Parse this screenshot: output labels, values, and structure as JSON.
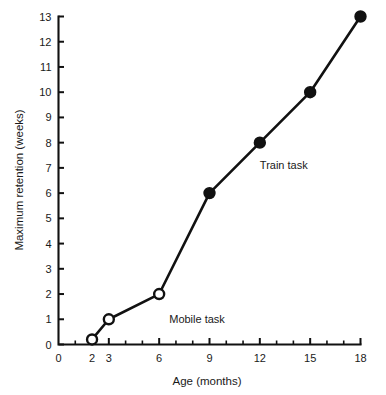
{
  "chart_data": {
    "type": "line",
    "title": "",
    "xlabel": "Age (months)",
    "ylabel": "Maximum retention (weeks)",
    "xlim": [
      0,
      18
    ],
    "ylim": [
      0,
      13
    ],
    "grid": false,
    "legend_position": "inline-annotation",
    "x_ticks_major": [
      0,
      2,
      3,
      6,
      9,
      12,
      15,
      18
    ],
    "x_tick_labels": [
      "0",
      "2",
      "3",
      "6",
      "9",
      "12",
      "15",
      "18"
    ],
    "x_ticks_minor": [
      1,
      4,
      5,
      7,
      8,
      10,
      11,
      13,
      14,
      16,
      17
    ],
    "y_ticks_major": [
      0,
      1,
      2,
      3,
      4,
      5,
      6,
      7,
      8,
      9,
      10,
      11,
      12,
      13
    ],
    "y_tick_labels": [
      "0",
      "1",
      "2",
      "3",
      "4",
      "5",
      "6",
      "7",
      "8",
      "9",
      "10",
      "11",
      "12",
      "13"
    ],
    "series": [
      {
        "name": "Mobile task",
        "marker": "open-circle",
        "x": [
          2,
          3,
          6
        ],
        "values": [
          0.2,
          1,
          2
        ]
      },
      {
        "name": "Train task",
        "marker": "filled-circle",
        "x": [
          9,
          12,
          15,
          18
        ],
        "values": [
          6,
          8,
          10,
          13
        ]
      }
    ],
    "annotations": [
      {
        "text": "Mobile task",
        "x": 6.6,
        "y": 0.85
      },
      {
        "text": "Train task",
        "x": 12.0,
        "y": 6.95
      }
    ],
    "colors": {
      "line": "#111111",
      "filled_marker": "#111111",
      "open_marker_fill": "#ffffff",
      "axis": "#111111",
      "text": "#1a1a1a",
      "background": "#ffffff"
    }
  }
}
